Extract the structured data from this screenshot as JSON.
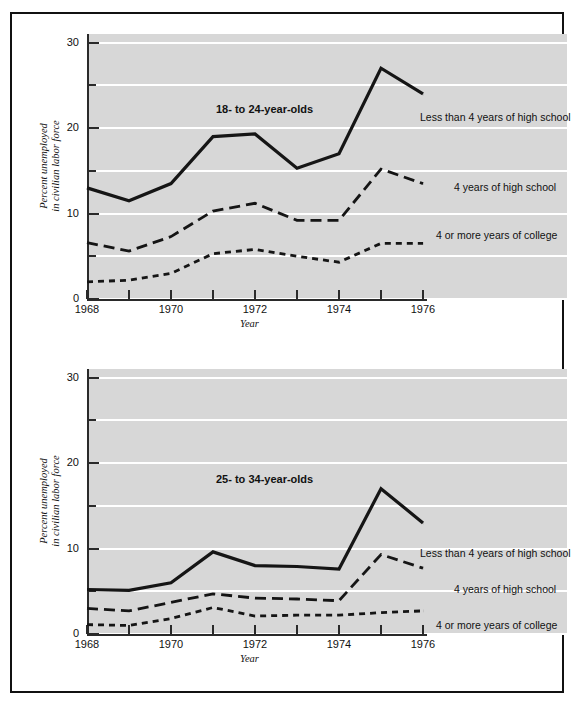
{
  "figure": {
    "background_color": "#ffffff",
    "frame_color": "#111111",
    "plot_background_color": "#d7d7d7",
    "gridline_color": "#ffffff",
    "series_color": "#151515"
  },
  "chart_data": [
    {
      "type": "line",
      "title": "18- to 24-year-olds",
      "xlabel": "Year",
      "ylabel": "Percent unemployed\nin civilian labor force",
      "ylabel_line1": "Percent unemployed",
      "ylabel_line2": "in civilian labor force",
      "x": [
        1968,
        1969,
        1970,
        1971,
        1972,
        1973,
        1974,
        1975,
        1976
      ],
      "xlim": [
        1968,
        1976
      ],
      "ylim": [
        0,
        31
      ],
      "ytick_labels": [
        "0",
        "10",
        "20",
        "30"
      ],
      "ytick_values": [
        0,
        10,
        20,
        30
      ],
      "yminor_values": [
        5,
        15,
        25
      ],
      "xtick_values": [
        1968,
        1969,
        1970,
        1971,
        1972,
        1973,
        1974,
        1975,
        1976
      ],
      "xtick_labels": [
        "1968",
        "",
        "1970",
        "",
        "1972",
        "",
        "1974",
        "",
        "1976"
      ],
      "grid": "horizontal",
      "legend_position": "inline-right",
      "series": [
        {
          "name": "Less than 4 years of high school",
          "style": "solid",
          "values": [
            13.0,
            11.5,
            13.5,
            19.0,
            19.3,
            15.3,
            17.0,
            27.0,
            24.0
          ]
        },
        {
          "name": "4 years of high school",
          "style": "long-dashed",
          "values": [
            6.6,
            5.6,
            7.3,
            10.3,
            11.2,
            9.2,
            9.2,
            15.2,
            13.5
          ]
        },
        {
          "name": "4 or more years of college",
          "style": "short-dashed",
          "values": [
            2.0,
            2.2,
            3.0,
            5.3,
            5.8,
            5.0,
            4.3,
            6.5,
            6.5
          ]
        }
      ]
    },
    {
      "type": "line",
      "title": "25- to 34-year-olds",
      "xlabel": "Year",
      "ylabel": "Percent unemployed\nin civilian labor force",
      "ylabel_line1": "Percent unemployed",
      "ylabel_line2": "in civilian labor force",
      "x": [
        1968,
        1969,
        1970,
        1971,
        1972,
        1973,
        1974,
        1975,
        1976
      ],
      "xlim": [
        1968,
        1976
      ],
      "ylim": [
        0,
        31
      ],
      "ytick_labels": [
        "0",
        "10",
        "20",
        "30"
      ],
      "ytick_values": [
        0,
        10,
        20,
        30
      ],
      "yminor_values": [
        5,
        15,
        25
      ],
      "xtick_values": [
        1968,
        1969,
        1970,
        1971,
        1972,
        1973,
        1974,
        1975,
        1976
      ],
      "xtick_labels": [
        "1968",
        "",
        "1970",
        "",
        "1972",
        "",
        "1974",
        "",
        "1976"
      ],
      "grid": "horizontal",
      "legend_position": "inline-right",
      "series": [
        {
          "name": "Less than 4 years of high school",
          "style": "solid",
          "values": [
            5.2,
            5.1,
            6.0,
            9.6,
            8.0,
            7.9,
            7.6,
            17.0,
            13.0
          ]
        },
        {
          "name": "4 years of high school",
          "style": "long-dashed",
          "values": [
            3.0,
            2.7,
            3.7,
            4.7,
            4.2,
            4.1,
            3.9,
            9.3,
            7.7
          ]
        },
        {
          "name": "4 or more years of college",
          "style": "short-dashed",
          "values": [
            1.1,
            1.0,
            1.8,
            3.1,
            2.1,
            2.2,
            2.2,
            2.5,
            2.7
          ]
        }
      ]
    }
  ]
}
